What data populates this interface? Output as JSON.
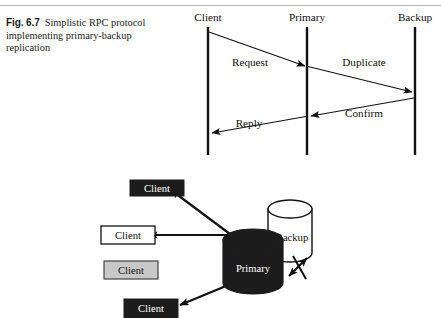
{
  "figure": {
    "number": "Fig. 6.7",
    "caption": "Simplistic RPC protocol implementing primary-backup replication"
  },
  "sequence_diagram": {
    "lifelines": [
      {
        "name": "client",
        "label": "Client",
        "x": 208
      },
      {
        "name": "primary",
        "label": "Primary",
        "x": 307
      },
      {
        "name": "backup",
        "label": "Backup",
        "x": 415
      }
    ],
    "messages": [
      {
        "name": "request",
        "label": "Request",
        "from": "client",
        "to": "primary"
      },
      {
        "name": "duplicate",
        "label": "Duplicate",
        "from": "primary",
        "to": "backup"
      },
      {
        "name": "confirm",
        "label": "Confirm",
        "from": "backup",
        "to": "primary"
      },
      {
        "name": "reply",
        "label": "Reply",
        "from": "primary",
        "to": "client"
      }
    ]
  },
  "architecture_diagram": {
    "clients": [
      {
        "name": "client-1",
        "label": "Client",
        "style": "filled-dark"
      },
      {
        "name": "client-2",
        "label": "Client",
        "style": "outlined-white"
      },
      {
        "name": "client-3",
        "label": "Client",
        "style": "filled-gray"
      },
      {
        "name": "client-4",
        "label": "Client",
        "style": "filled-dark"
      }
    ],
    "servers": [
      {
        "name": "backup",
        "label": "Backup",
        "style": "cylinder-white"
      },
      {
        "name": "primary",
        "label": "Primary",
        "style": "cylinder-black"
      }
    ],
    "link_status": {
      "name": "broken-link",
      "label": ""
    }
  },
  "colors": {
    "ink": "#111111",
    "dark_fill": "#1c1c1c",
    "gray_fill": "#c8c8c8",
    "white_fill": "#ffffff",
    "rule": "#b9b9b9"
  }
}
